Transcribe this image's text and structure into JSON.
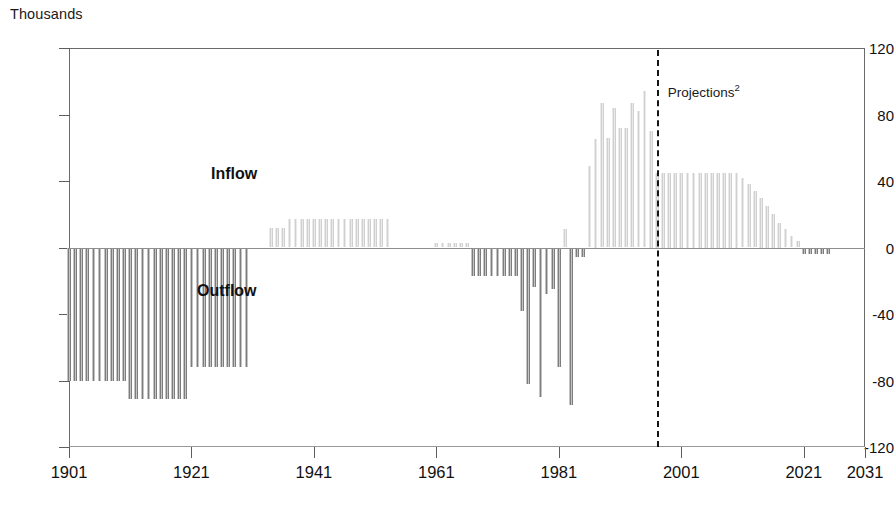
{
  "unit_label": "Thousands",
  "annotations": {
    "inflow": "Inflow",
    "outflow": "Outflow",
    "projections": "Projections",
    "projections_footnote": "2"
  },
  "chart_data": {
    "type": "bar",
    "title": "",
    "subtitle": "",
    "xlabel": "",
    "ylabel": "Thousands",
    "ylim": [
      -120,
      120
    ],
    "xlim": [
      1901,
      2031
    ],
    "yticks": [
      120,
      80,
      40,
      0,
      -40,
      -80,
      -120
    ],
    "xticks": [
      1901,
      1921,
      1941,
      1961,
      1981,
      2001,
      2021,
      2031
    ],
    "grid": false,
    "legend": "none",
    "colors": {
      "inflow": "#d0d0d0",
      "outflow": "#7d7d7d",
      "axis": "#6a6a6a",
      "text": "#111111",
      "projection_divider": "#151515"
    },
    "series": [
      {
        "name": "Net migration",
        "note": "Positive values = Inflow, negative values = Outflow. Annual values 1901-2031.",
        "x": [
          1901,
          1902,
          1903,
          1904,
          1905,
          1906,
          1907,
          1908,
          1909,
          1910,
          1911,
          1912,
          1913,
          1914,
          1915,
          1916,
          1917,
          1918,
          1919,
          1920,
          1921,
          1922,
          1923,
          1924,
          1925,
          1926,
          1927,
          1928,
          1929,
          1930,
          1931,
          1932,
          1933,
          1934,
          1935,
          1936,
          1937,
          1938,
          1939,
          1940,
          1941,
          1942,
          1943,
          1944,
          1945,
          1946,
          1947,
          1948,
          1949,
          1950,
          1951,
          1952,
          1953,
          1954,
          1955,
          1956,
          1957,
          1958,
          1959,
          1960,
          1961,
          1962,
          1963,
          1964,
          1965,
          1966,
          1967,
          1968,
          1969,
          1970,
          1971,
          1972,
          1973,
          1974,
          1975,
          1976,
          1977,
          1978,
          1979,
          1980,
          1981,
          1982,
          1983,
          1984,
          1985,
          1986,
          1987,
          1988,
          1989,
          1990,
          1991,
          1992,
          1993,
          1994,
          1995,
          1996,
          1997,
          1998,
          1999,
          2000,
          2001,
          2002,
          2003,
          2004,
          2005,
          2006,
          2007,
          2008,
          2009,
          2010,
          2011,
          2012,
          2013,
          2014,
          2015,
          2016,
          2017,
          2018,
          2019,
          2020,
          2021,
          2022,
          2023,
          2024,
          2025,
          2026,
          2027,
          2028,
          2029,
          2030
        ],
        "values": [
          -80,
          -80,
          -80,
          -80,
          -80,
          -80,
          -80,
          -80,
          -80,
          -80,
          -91,
          -91,
          -91,
          -91,
          -91,
          -91,
          -91,
          -91,
          -91,
          -91,
          -72,
          -72,
          -72,
          -72,
          -72,
          -72,
          -72,
          -72,
          -72,
          -72,
          0,
          0,
          0,
          12,
          12,
          12,
          17,
          17,
          17,
          17,
          17,
          17,
          17,
          17,
          17,
          17,
          17,
          17,
          17,
          17,
          17,
          17,
          17,
          0,
          0,
          0,
          0,
          0,
          0,
          0,
          3,
          3,
          3,
          3,
          3,
          3,
          -17,
          -17,
          -17,
          -17,
          -17,
          -17,
          -17,
          -17,
          -38,
          -82,
          -24,
          -90,
          -28,
          -25,
          -72,
          11,
          -95,
          -6,
          -6,
          49,
          65,
          87,
          66,
          84,
          72,
          72,
          87,
          82,
          94,
          70,
          45,
          45,
          45,
          45,
          45,
          45,
          45,
          45,
          45,
          45,
          45,
          45,
          45,
          45,
          42,
          38,
          34,
          30,
          25,
          20,
          15,
          11,
          7,
          4,
          -4,
          -4,
          -4,
          -4,
          -4,
          -4,
          -4,
          -4,
          -4,
          -4
        ]
      }
    ],
    "projection_start_year": 1997,
    "bars": [
      {
        "year": 1901,
        "value": -80
      },
      {
        "year": 1902,
        "value": -80
      },
      {
        "year": 1903,
        "value": -80
      },
      {
        "year": 1904,
        "value": -80
      },
      {
        "year": 1905,
        "value": -80
      },
      {
        "year": 1906,
        "value": -80
      },
      {
        "year": 1907,
        "value": -80
      },
      {
        "year": 1908,
        "value": -80
      },
      {
        "year": 1909,
        "value": -80
      },
      {
        "year": 1910,
        "value": -80
      },
      {
        "year": 1911,
        "value": -91
      },
      {
        "year": 1912,
        "value": -91
      },
      {
        "year": 1913,
        "value": -91
      },
      {
        "year": 1914,
        "value": -91
      },
      {
        "year": 1915,
        "value": -91
      },
      {
        "year": 1916,
        "value": -91
      },
      {
        "year": 1917,
        "value": -91
      },
      {
        "year": 1918,
        "value": -91
      },
      {
        "year": 1919,
        "value": -91
      },
      {
        "year": 1920,
        "value": -91
      },
      {
        "year": 1921,
        "value": -72
      },
      {
        "year": 1922,
        "value": -72
      },
      {
        "year": 1923,
        "value": -72
      },
      {
        "year": 1924,
        "value": -72
      },
      {
        "year": 1925,
        "value": -72
      },
      {
        "year": 1926,
        "value": -72
      },
      {
        "year": 1927,
        "value": -72
      },
      {
        "year": 1928,
        "value": -72
      },
      {
        "year": 1929,
        "value": -72
      },
      {
        "year": 1930,
        "value": -72
      },
      {
        "year": 1934,
        "value": 12
      },
      {
        "year": 1935,
        "value": 12
      },
      {
        "year": 1936,
        "value": 12
      },
      {
        "year": 1937,
        "value": 17
      },
      {
        "year": 1938,
        "value": 17
      },
      {
        "year": 1939,
        "value": 17
      },
      {
        "year": 1940,
        "value": 17
      },
      {
        "year": 1941,
        "value": 17
      },
      {
        "year": 1942,
        "value": 17
      },
      {
        "year": 1943,
        "value": 17
      },
      {
        "year": 1944,
        "value": 17
      },
      {
        "year": 1945,
        "value": 17
      },
      {
        "year": 1946,
        "value": 17
      },
      {
        "year": 1947,
        "value": 17
      },
      {
        "year": 1948,
        "value": 17
      },
      {
        "year": 1949,
        "value": 17
      },
      {
        "year": 1950,
        "value": 17
      },
      {
        "year": 1951,
        "value": 17
      },
      {
        "year": 1952,
        "value": 17
      },
      {
        "year": 1953,
        "value": 17
      },
      {
        "year": 1961,
        "value": 3
      },
      {
        "year": 1962,
        "value": 3
      },
      {
        "year": 1963,
        "value": 3
      },
      {
        "year": 1964,
        "value": 3
      },
      {
        "year": 1965,
        "value": 3
      },
      {
        "year": 1966,
        "value": 3
      },
      {
        "year": 1967,
        "value": -17
      },
      {
        "year": 1968,
        "value": -17
      },
      {
        "year": 1969,
        "value": -17
      },
      {
        "year": 1970,
        "value": -17
      },
      {
        "year": 1971,
        "value": -17
      },
      {
        "year": 1972,
        "value": -17
      },
      {
        "year": 1973,
        "value": -17
      },
      {
        "year": 1974,
        "value": -17
      },
      {
        "year": 1975,
        "value": -38
      },
      {
        "year": 1976,
        "value": -82
      },
      {
        "year": 1977,
        "value": -24
      },
      {
        "year": 1978,
        "value": -90
      },
      {
        "year": 1979,
        "value": -28
      },
      {
        "year": 1980,
        "value": -25
      },
      {
        "year": 1981,
        "value": -72
      },
      {
        "year": 1982,
        "value": 11
      },
      {
        "year": 1983,
        "value": -95
      },
      {
        "year": 1984,
        "value": -6
      },
      {
        "year": 1985,
        "value": -6
      },
      {
        "year": 1986,
        "value": 49
      },
      {
        "year": 1987,
        "value": 65
      },
      {
        "year": 1988,
        "value": 87
      },
      {
        "year": 1989,
        "value": 66
      },
      {
        "year": 1990,
        "value": 84
      },
      {
        "year": 1991,
        "value": 72
      },
      {
        "year": 1992,
        "value": 72
      },
      {
        "year": 1993,
        "value": 87
      },
      {
        "year": 1994,
        "value": 82
      },
      {
        "year": 1995,
        "value": 94
      },
      {
        "year": 1996,
        "value": 70
      },
      {
        "year": 1997,
        "value": 45
      },
      {
        "year": 1998,
        "value": 45
      },
      {
        "year": 1999,
        "value": 45
      },
      {
        "year": 2000,
        "value": 45
      },
      {
        "year": 2001,
        "value": 45
      },
      {
        "year": 2002,
        "value": 45
      },
      {
        "year": 2003,
        "value": 45
      },
      {
        "year": 2004,
        "value": 45
      },
      {
        "year": 2005,
        "value": 45
      },
      {
        "year": 2006,
        "value": 45
      },
      {
        "year": 2007,
        "value": 45
      },
      {
        "year": 2008,
        "value": 45
      },
      {
        "year": 2009,
        "value": 45
      },
      {
        "year": 2010,
        "value": 45
      },
      {
        "year": 2011,
        "value": 42
      },
      {
        "year": 2012,
        "value": 38
      },
      {
        "year": 2013,
        "value": 34
      },
      {
        "year": 2014,
        "value": 30
      },
      {
        "year": 2015,
        "value": 25
      },
      {
        "year": 2016,
        "value": 20
      },
      {
        "year": 2017,
        "value": 15
      },
      {
        "year": 2018,
        "value": 11
      },
      {
        "year": 2019,
        "value": 7
      },
      {
        "year": 2020,
        "value": 4
      },
      {
        "year": 2021,
        "value": -4
      },
      {
        "year": 2022,
        "value": -4
      },
      {
        "year": 2023,
        "value": -4
      },
      {
        "year": 2024,
        "value": -4
      },
      {
        "year": 2025,
        "value": -4
      }
    ]
  }
}
